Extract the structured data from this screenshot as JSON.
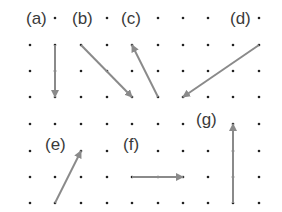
{
  "colors": {
    "arrow": "#8a8a8a",
    "dot": "#222222",
    "label": "#3a3a3a"
  },
  "grid": {
    "xs": [
      30,
      55,
      81,
      107,
      132,
      158,
      183,
      208,
      233,
      259
    ],
    "top_rows": [
      18,
      45,
      71,
      97
    ],
    "bottom_rows": [
      124,
      151,
      177,
      203
    ]
  },
  "labels": [
    {
      "id": "a",
      "text": "(a)",
      "x": 25,
      "y": 19
    },
    {
      "id": "b",
      "text": "(b)",
      "x": 71,
      "y": 19
    },
    {
      "id": "c",
      "text": "(c)",
      "x": 120,
      "y": 19
    },
    {
      "id": "d",
      "text": "(d)",
      "x": 229,
      "y": 19
    },
    {
      "id": "e",
      "text": "(e)",
      "x": 44,
      "y": 145
    },
    {
      "id": "f",
      "text": "(f)",
      "x": 122,
      "y": 145
    },
    {
      "id": "g",
      "text": "(g)",
      "x": 195,
      "y": 120
    }
  ],
  "arrows": [
    {
      "id": "a",
      "x1": 55,
      "y1": 45,
      "x2": 55,
      "y2": 97
    },
    {
      "id": "b",
      "x1": 81,
      "y1": 45,
      "x2": 132,
      "y2": 97
    },
    {
      "id": "c",
      "x1": 158,
      "y1": 97,
      "x2": 132,
      "y2": 45
    },
    {
      "id": "d",
      "x1": 259,
      "y1": 45,
      "x2": 183,
      "y2": 97
    },
    {
      "id": "e",
      "x1": 55,
      "y1": 203,
      "x2": 81,
      "y2": 151
    },
    {
      "id": "f",
      "x1": 132,
      "y1": 177,
      "x2": 183,
      "y2": 177
    },
    {
      "id": "g",
      "x1": 233,
      "y1": 203,
      "x2": 233,
      "y2": 124
    }
  ]
}
